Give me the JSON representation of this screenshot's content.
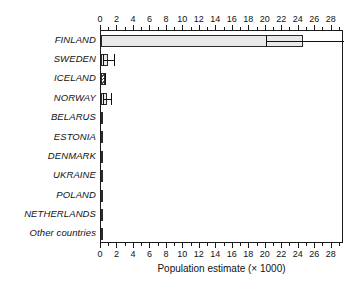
{
  "chart_data": {
    "type": "bar",
    "orientation": "horizontal",
    "title": "",
    "xlabel": "Population estimate (× 1000)",
    "ylabel": "",
    "xlim": [
      0,
      29.5
    ],
    "grid": false,
    "legend": null,
    "tick_step_major": 2,
    "tick_step_minor": 1,
    "xticks": [
      0,
      2,
      4,
      6,
      8,
      10,
      12,
      14,
      16,
      18,
      20,
      22,
      24,
      26,
      28
    ],
    "xtick_labels": [
      "0",
      "2",
      "4",
      "6",
      "8",
      "10",
      "12",
      "14",
      "16",
      "18",
      "20",
      "22",
      "24",
      "26",
      "28"
    ],
    "axes_shown": [
      "top",
      "bottom"
    ],
    "categories": [
      "FINLAND",
      "SWEDEN",
      "ICELAND",
      "NORWAY",
      "BELARUS",
      "ESTONIA",
      "DENMARK",
      "UKRAINE",
      "POLAND",
      "NETHERLANDS",
      "Other countries"
    ],
    "values": [
      24.5,
      0.9,
      0.5,
      0.7,
      0.15,
      0.2,
      0.2,
      0.25,
      0.12,
      0.15,
      0.1
    ],
    "error_low": [
      20.0,
      0.2,
      0.5,
      0.2,
      null,
      null,
      null,
      null,
      null,
      null,
      null
    ],
    "error_high": [
      29.5,
      1.6,
      0.5,
      1.2,
      null,
      null,
      null,
      null,
      null,
      null,
      null
    ],
    "bar_styles": [
      "solid-light",
      "solid-light",
      "hatched",
      "solid-light",
      "solid-dark",
      "solid-light",
      "solid-light",
      "solid-dark",
      "solid-dark",
      "solid-light",
      "solid-dark"
    ],
    "colors": {
      "bar_fill": "#e9e9e9",
      "bar_fill_dark": "#4d4d4d",
      "bar_edge": "#2a2a2a",
      "axis": "#1a1a1a",
      "text": "#111111",
      "background": "#ffffff"
    }
  },
  "axis_top": {
    "labels": [
      "0",
      "2",
      "4",
      "6",
      "8",
      "10",
      "12",
      "14",
      "16",
      "18",
      "20",
      "22",
      "24",
      "26",
      "28"
    ]
  },
  "axis_bottom": {
    "labels": [
      "0",
      "2",
      "4",
      "6",
      "8",
      "10",
      "12",
      "14",
      "16",
      "18",
      "20",
      "22",
      "24",
      "26",
      "28"
    ],
    "title": "Population estimate (× 1000)"
  }
}
